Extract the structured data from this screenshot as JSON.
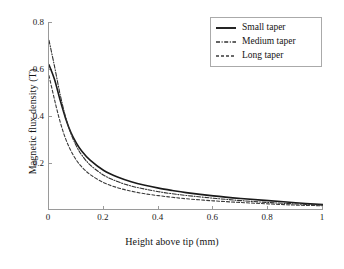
{
  "chart_data": {
    "type": "line",
    "title": "",
    "xlabel": "Height above tip (mm)",
    "ylabel": "Magnetic flux density (T)",
    "xlim": [
      0,
      1
    ],
    "ylim": [
      0,
      0.8
    ],
    "xticks": [
      "0",
      "0.2",
      "0.4",
      "0.6",
      "0.8",
      "1"
    ],
    "xtick_values": [
      0,
      0.2,
      0.4,
      0.6,
      0.8,
      1
    ],
    "yticks": [
      "0.2",
      "0.4",
      "0.6",
      "0.8"
    ],
    "ytick_values": [
      0.2,
      0.4,
      0.6,
      0.8
    ],
    "grid": false,
    "legend_position": "upper right",
    "x": [
      0,
      0.02,
      0.04,
      0.06,
      0.08,
      0.1,
      0.12,
      0.15,
      0.2,
      0.25,
      0.3,
      0.35,
      0.4,
      0.45,
      0.5,
      0.6,
      0.7,
      0.8,
      0.9,
      1.0
    ],
    "series": [
      {
        "name": "Small taper",
        "style": "solid",
        "color": "#1a1a1a",
        "values": [
          0.618,
          0.556,
          0.47,
          0.392,
          0.33,
          0.285,
          0.25,
          0.212,
          0.168,
          0.14,
          0.12,
          0.105,
          0.093,
          0.083,
          0.074,
          0.06,
          0.049,
          0.04,
          0.031,
          0.023
        ]
      },
      {
        "name": "Medium taper",
        "style": "dashdot",
        "color": "#303030",
        "values": [
          0.722,
          0.612,
          0.495,
          0.398,
          0.325,
          0.272,
          0.233,
          0.192,
          0.148,
          0.121,
          0.102,
          0.089,
          0.078,
          0.069,
          0.062,
          0.05,
          0.04,
          0.032,
          0.026,
          0.021
        ]
      },
      {
        "name": "Long taper",
        "style": "dashed",
        "color": "#3a3a3a",
        "values": [
          0.572,
          0.47,
          0.378,
          0.305,
          0.252,
          0.212,
          0.183,
          0.151,
          0.116,
          0.095,
          0.08,
          0.069,
          0.061,
          0.054,
          0.048,
          0.039,
          0.032,
          0.026,
          0.021,
          0.018
        ]
      }
    ]
  },
  "legend": {
    "entries": [
      {
        "label": "Small taper"
      },
      {
        "label": "Medium taper"
      },
      {
        "label": "Long taper"
      }
    ]
  },
  "axes": {
    "x_title": "Height above tip (mm)",
    "y_title": "Magnetic flux density (T)",
    "x_labels": [
      "0",
      "0.2",
      "0.4",
      "0.6",
      "0.8",
      "1"
    ],
    "y_labels": [
      "0.2",
      "0.4",
      "0.6",
      "0.8"
    ]
  },
  "colors": {
    "axis": "#9a9a9a",
    "text": "#141414",
    "curve_solid": "#1a1a1a",
    "curve_dashdot": "#303030",
    "curve_dashed": "#3a3a3a",
    "background": "#ffffff"
  }
}
